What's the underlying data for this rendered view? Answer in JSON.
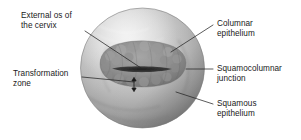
{
  "figure": {
    "subject": "cervix",
    "view": "colposcopic frontal view",
    "style": "grayscale medical illustration",
    "background_color": "#ffffff",
    "line_color": "#262626",
    "text_color": "#1a1a1a"
  },
  "labels": {
    "external_os": "External os of\nthe cervix",
    "transformation_zone": "Transformation\nzone",
    "columnar_epithelium": "Columnar\nepithelium",
    "squamocolumnar_junction": "Squamocolumnar\njunction",
    "squamous_epithelium": "Squamous\nepithelium"
  },
  "structures": {
    "cervix_body": "cervix-sphere",
    "columnar_region": "columnar-epithelium-region",
    "os_slit": "external-os-slit",
    "zone_marker": "transformation-zone-arrow"
  },
  "colors": {
    "sphere_light": "#e8e8e8",
    "sphere_mid": "#b4b4b4",
    "sphere_dark": "#8a8a8a",
    "sphere_edge": "#6e6e6e",
    "columnar_mid": "#8f8f8f",
    "columnar_dark": "#6a6a6a",
    "os_dark": "#2e2e2e",
    "leader": "#262626"
  }
}
